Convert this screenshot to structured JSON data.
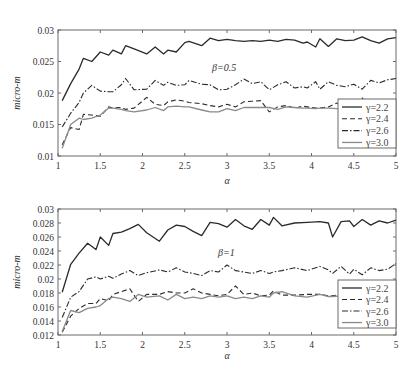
{
  "figure": {
    "caption": ""
  },
  "chart_data": [
    {
      "type": "line",
      "title": "",
      "annotation": "β=0.5",
      "xlabel": "α",
      "ylabel": "micro-m",
      "xlim": [
        1,
        5
      ],
      "ylim": [
        0.01,
        0.03
      ],
      "xticks": [
        "1",
        "1.5",
        "2",
        "2.5",
        "3",
        "3.5",
        "4",
        "4.5",
        "5"
      ],
      "yticks": [
        "0.01",
        "0.015",
        "0.02",
        "0.025",
        "0.03"
      ],
      "grid": false,
      "legend_position": "lower right",
      "x": [
        1.05,
        1.15,
        1.25,
        1.3,
        1.4,
        1.5,
        1.6,
        1.65,
        1.75,
        1.8,
        1.9,
        2.05,
        2.15,
        2.25,
        2.3,
        2.4,
        2.5,
        2.55,
        2.7,
        2.8,
        2.9,
        3.0,
        3.1,
        3.2,
        3.3,
        3.4,
        3.5,
        3.6,
        3.7,
        3.8,
        3.9,
        3.95,
        4.05,
        4.1,
        4.2,
        4.3,
        4.4,
        4.5,
        4.6,
        4.7,
        4.8,
        4.9,
        5.0
      ],
      "series": [
        {
          "name": "γ=2.2",
          "style": "solid-dark",
          "values": [
            0.0188,
            0.0215,
            0.0238,
            0.0255,
            0.025,
            0.0265,
            0.026,
            0.0268,
            0.0262,
            0.0275,
            0.027,
            0.0262,
            0.0273,
            0.0262,
            0.0268,
            0.0265,
            0.028,
            0.0282,
            0.0275,
            0.0287,
            0.0283,
            0.0285,
            0.0283,
            0.0282,
            0.0283,
            0.0282,
            0.0284,
            0.0282,
            0.0285,
            0.0284,
            0.0279,
            0.0281,
            0.0273,
            0.0286,
            0.0274,
            0.0286,
            0.0283,
            0.0284,
            0.0289,
            0.0283,
            0.0279,
            0.0286,
            0.0288
          ]
        },
        {
          "name": "γ=2.4",
          "style": "dashed",
          "values": [
            0.0118,
            0.0145,
            0.0142,
            0.0166,
            0.0165,
            0.0163,
            0.0178,
            0.0176,
            0.0177,
            0.0174,
            0.0176,
            0.0193,
            0.0182,
            0.018,
            0.0186,
            0.0189,
            0.0187,
            0.0185,
            0.0183,
            0.018,
            0.0178,
            0.0182,
            0.0178,
            0.0186,
            0.0187,
            0.0188,
            0.017,
            0.0178,
            0.018,
            0.0176,
            0.0179,
            0.0178,
            0.0176,
            0.0176,
            0.0178,
            0.0184,
            0.0176,
            0.0178,
            0.0192,
            0.0178,
            0.018,
            0.0181,
            0.0182
          ]
        },
        {
          "name": "γ=2.6",
          "style": "dash-dot",
          "values": [
            0.0146,
            0.0168,
            0.0185,
            0.02,
            0.0212,
            0.0203,
            0.0202,
            0.0202,
            0.0213,
            0.0223,
            0.0205,
            0.0206,
            0.022,
            0.0212,
            0.0217,
            0.0212,
            0.0213,
            0.022,
            0.0214,
            0.0213,
            0.0205,
            0.0206,
            0.0213,
            0.0222,
            0.0215,
            0.0218,
            0.0205,
            0.0213,
            0.0218,
            0.0208,
            0.021,
            0.0208,
            0.0218,
            0.0206,
            0.0218,
            0.0212,
            0.021,
            0.0214,
            0.0206,
            0.022,
            0.0216,
            0.0221,
            0.0223
          ]
        },
        {
          "name": "γ=3.0",
          "style": "solid-light",
          "values": [
            0.0112,
            0.015,
            0.016,
            0.0158,
            0.016,
            0.0165,
            0.0176,
            0.0176,
            0.0174,
            0.0172,
            0.017,
            0.0173,
            0.0177,
            0.0172,
            0.0178,
            0.0179,
            0.0178,
            0.0178,
            0.0173,
            0.017,
            0.017,
            0.0175,
            0.0172,
            0.0177,
            0.0177,
            0.0177,
            0.0177,
            0.0174,
            0.0178,
            0.0177,
            0.0176,
            0.0176,
            0.0175,
            0.0176,
            0.0176,
            0.0175,
            0.0175,
            0.0176,
            0.0177,
            0.0176,
            0.0178,
            0.0179,
            0.0179
          ]
        }
      ]
    },
    {
      "type": "line",
      "title": "",
      "annotation": "β=1",
      "xlabel": "α",
      "ylabel": "micro-m",
      "xlim": [
        1,
        5
      ],
      "ylim": [
        0.012,
        0.03
      ],
      "xticks": [
        "1",
        "1.5",
        "2",
        "2.5",
        "3",
        "3.5",
        "4",
        "4.5",
        "5"
      ],
      "yticks": [
        "0.012",
        "0.014",
        "0.016",
        "0.018",
        "0.02",
        "0.022",
        "0.024",
        "0.026",
        "0.028",
        "0.03"
      ],
      "grid": false,
      "legend_position": "lower right",
      "x": [
        1.05,
        1.15,
        1.25,
        1.35,
        1.45,
        1.5,
        1.6,
        1.65,
        1.75,
        1.85,
        1.95,
        2.05,
        2.2,
        2.3,
        2.4,
        2.5,
        2.6,
        2.7,
        2.8,
        2.9,
        3.0,
        3.1,
        3.2,
        3.3,
        3.4,
        3.5,
        3.55,
        3.65,
        3.8,
        3.95,
        4.1,
        4.2,
        4.25,
        4.35,
        4.45,
        4.5,
        4.6,
        4.7,
        4.8,
        4.9,
        5.0
      ],
      "series": [
        {
          "name": "γ=2.2",
          "style": "solid-dark",
          "values": [
            0.0181,
            0.0221,
            0.0237,
            0.0251,
            0.0242,
            0.026,
            0.0248,
            0.0265,
            0.0267,
            0.0272,
            0.0278,
            0.0266,
            0.0254,
            0.027,
            0.0277,
            0.0275,
            0.0268,
            0.0262,
            0.0281,
            0.0279,
            0.0274,
            0.0285,
            0.0276,
            0.0271,
            0.0285,
            0.0277,
            0.0288,
            0.0276,
            0.028,
            0.0281,
            0.0282,
            0.028,
            0.026,
            0.0282,
            0.0283,
            0.0275,
            0.0285,
            0.0277,
            0.0283,
            0.028,
            0.0284
          ]
        },
        {
          "name": "γ=2.4",
          "style": "dashed",
          "values": [
            0.0124,
            0.0147,
            0.0158,
            0.0165,
            0.0165,
            0.0172,
            0.0169,
            0.0178,
            0.0182,
            0.0186,
            0.0168,
            0.0178,
            0.0178,
            0.0182,
            0.018,
            0.018,
            0.0186,
            0.018,
            0.0178,
            0.0176,
            0.0178,
            0.019,
            0.0178,
            0.018,
            0.0176,
            0.0177,
            0.0183,
            0.0177,
            0.0177,
            0.0178,
            0.0178,
            0.0176,
            0.0176,
            0.0178,
            0.018,
            0.0178,
            0.018,
            0.0179,
            0.018,
            0.018,
            0.0181
          ]
        },
        {
          "name": "γ=2.6",
          "style": "dash-dot",
          "values": [
            0.0145,
            0.0174,
            0.0182,
            0.02,
            0.0203,
            0.02,
            0.0204,
            0.0201,
            0.0207,
            0.0212,
            0.0205,
            0.0209,
            0.0213,
            0.021,
            0.0216,
            0.021,
            0.0208,
            0.0205,
            0.0212,
            0.021,
            0.022,
            0.0212,
            0.021,
            0.0208,
            0.0212,
            0.0208,
            0.021,
            0.0212,
            0.0216,
            0.0212,
            0.0218,
            0.0213,
            0.0208,
            0.0218,
            0.0207,
            0.0214,
            0.0206,
            0.0216,
            0.0212,
            0.0214,
            0.0222
          ]
        },
        {
          "name": "γ=3.0",
          "style": "solid-light",
          "values": [
            0.0125,
            0.0155,
            0.0152,
            0.0158,
            0.016,
            0.0162,
            0.0172,
            0.0174,
            0.0172,
            0.0168,
            0.0178,
            0.0174,
            0.0176,
            0.017,
            0.0178,
            0.0172,
            0.0174,
            0.0172,
            0.0176,
            0.0174,
            0.0176,
            0.0172,
            0.0174,
            0.0172,
            0.0176,
            0.0174,
            0.018,
            0.0182,
            0.0176,
            0.0174,
            0.0178,
            0.0175,
            0.0175,
            0.0176,
            0.0178,
            0.0176,
            0.0177,
            0.0176,
            0.0178,
            0.0178,
            0.0178
          ]
        }
      ]
    }
  ],
  "legend": {
    "entries": [
      "γ=2.2",
      "γ=2.4",
      "γ=2.6",
      "γ=3.0"
    ]
  },
  "colors": {
    "frame": "#6a6a6a",
    "series_dark": "#2b2b2b",
    "series_light": "#8a8a8a"
  }
}
